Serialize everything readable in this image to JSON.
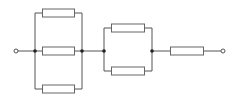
{
  "diagram": {
    "type": "circuit-schematic",
    "colors": {
      "wire": "#555555",
      "resistor_stroke": "#666666",
      "resistor_fill": "#ffffff",
      "node": "#222222",
      "terminal_fill": "#ffffff",
      "background": "#ffffff"
    },
    "terminals": [
      {
        "id": "input-terminal",
        "x": 16,
        "y": 51
      },
      {
        "id": "output-terminal",
        "x": 223,
        "y": 51
      }
    ],
    "blocks": [
      {
        "id": "parallel-block-1",
        "branches": 3,
        "left_bus_x": 35,
        "right_bus_x": 82
      },
      {
        "id": "parallel-block-2",
        "branches": 2,
        "left_bus_x": 104,
        "right_bus_x": 152
      },
      {
        "id": "series-resistor",
        "branches": 1
      }
    ],
    "resistor_count": 6,
    "junction_count": 4
  }
}
